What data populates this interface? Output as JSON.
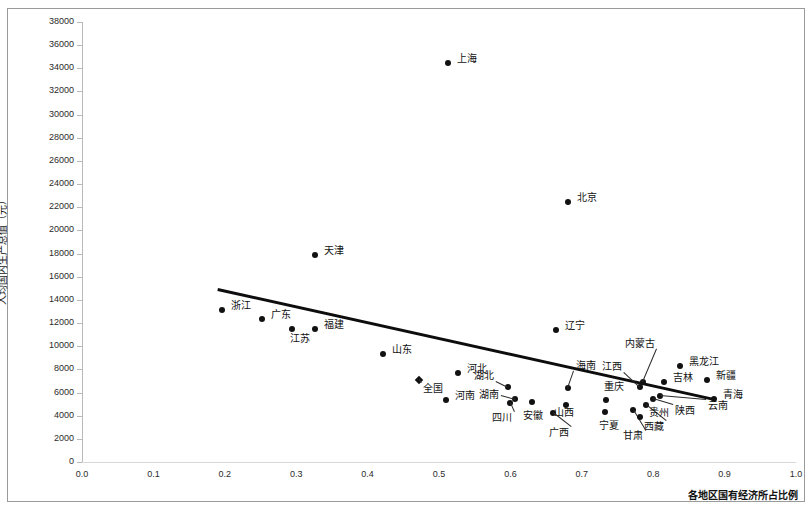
{
  "chart_data": {
    "type": "scatter",
    "title": "",
    "xlabel": "各地区国有经济所占比例",
    "ylabel": "人均国内生产总值（元）",
    "xlim": [
      0.0,
      1.0
    ],
    "ylim": [
      0,
      38000
    ],
    "xticks": [
      "0.0",
      "0.1",
      "0.2",
      "0.3",
      "0.4",
      "0.5",
      "0.6",
      "0.7",
      "0.8",
      "0.9",
      "1.0"
    ],
    "yticks": [
      "0",
      "2000",
      "4000",
      "6000",
      "8000",
      "10000",
      "12000",
      "14000",
      "16000",
      "18000",
      "20000",
      "22000",
      "24000",
      "26000",
      "28000",
      "30000",
      "32000",
      "34000",
      "36000",
      "38000"
    ],
    "grid": false,
    "legend": "none",
    "marker_color": "#111111",
    "trendline": {
      "color": "#0d0d0d",
      "x0": 0.19,
      "y0": 15000,
      "x1": 0.885,
      "y1": 5500
    },
    "points": [
      {
        "name": "上海",
        "x": 0.512,
        "y": 34500,
        "label_dx": 9,
        "label_dy": -4,
        "leader": false
      },
      {
        "name": "北京",
        "x": 0.68,
        "y": 22450,
        "label_dx": 9,
        "label_dy": -4,
        "leader": false
      },
      {
        "name": "天津",
        "x": 0.327,
        "y": 17850,
        "label_dx": 9,
        "label_dy": -4,
        "leader": false
      },
      {
        "name": "浙江",
        "x": 0.196,
        "y": 13100,
        "label_dx": 9,
        "label_dy": -4,
        "leader": false
      },
      {
        "name": "广东",
        "x": 0.252,
        "y": 12350,
        "label_dx": 9,
        "label_dy": -4,
        "leader": false
      },
      {
        "name": "江苏",
        "x": 0.294,
        "y": 11450,
        "label_dx": -2,
        "label_dy": 10,
        "leader": false
      },
      {
        "name": "福建",
        "x": 0.326,
        "y": 11450,
        "label_dx": 9,
        "label_dy": -4,
        "leader": false
      },
      {
        "name": "山东",
        "x": 0.422,
        "y": 9350,
        "label_dx": 9,
        "label_dy": -4,
        "leader": false
      },
      {
        "name": "辽宁",
        "x": 0.664,
        "y": 11400,
        "label_dx": 9,
        "label_dy": -4,
        "leader": false
      },
      {
        "name": "全国",
        "x": 0.472,
        "y": 7100,
        "label_dx": 4,
        "label_dy": 9,
        "leader": true,
        "marker": "diamond"
      },
      {
        "name": "河北",
        "x": 0.527,
        "y": 7700,
        "label_dx": 9,
        "label_dy": -4,
        "leader": false
      },
      {
        "name": "河南",
        "x": 0.51,
        "y": 5350,
        "label_dx": 9,
        "label_dy": -4,
        "leader": false
      },
      {
        "name": "湖北",
        "x": 0.597,
        "y": 6450,
        "label_dx": -34,
        "label_dy": -11,
        "leader": true
      },
      {
        "name": "湖南",
        "x": 0.607,
        "y": 5400,
        "label_dx": -36,
        "label_dy": -4,
        "leader": true
      },
      {
        "name": "海南",
        "x": 0.68,
        "y": 6400,
        "label_dx": 8,
        "label_dy": -22,
        "leader": true
      },
      {
        "name": "重庆",
        "x": 0.734,
        "y": 5350,
        "label_dx": -2,
        "label_dy": -13,
        "leader": false
      },
      {
        "name": "四川",
        "x": 0.6,
        "y": 5100,
        "label_dx": -18,
        "label_dy": 15,
        "leader": true
      },
      {
        "name": "安徽",
        "x": 0.63,
        "y": 5150,
        "label_dx": -9,
        "label_dy": 14,
        "leader": false
      },
      {
        "name": "山西",
        "x": 0.678,
        "y": 4950,
        "label_dx": -12,
        "label_dy": 8,
        "leader": false
      },
      {
        "name": "广西",
        "x": 0.66,
        "y": 4200,
        "label_dx": -4,
        "label_dy": 20,
        "leader": true
      },
      {
        "name": "宁夏",
        "x": 0.733,
        "y": 4350,
        "label_dx": -6,
        "label_dy": 14,
        "leader": false
      },
      {
        "name": "甘肃",
        "x": 0.772,
        "y": 4450,
        "label_dx": -10,
        "label_dy": 26,
        "leader": true
      },
      {
        "name": "西藏",
        "x": 0.79,
        "y": 4950,
        "label_dx": -2,
        "label_dy": 22,
        "leader": true
      },
      {
        "name": "贵州",
        "x": 0.782,
        "y": 3900,
        "label_dx": 9,
        "label_dy": -4,
        "leader": false
      },
      {
        "name": "陕西",
        "x": 0.8,
        "y": 5400,
        "label_dx": 22,
        "label_dy": 12,
        "leader": true
      },
      {
        "name": "云南",
        "x": 0.81,
        "y": 5700,
        "label_dx": 48,
        "label_dy": 10,
        "leader": true
      },
      {
        "name": "江西",
        "x": 0.782,
        "y": 6450,
        "label_dx": -38,
        "label_dy": -20,
        "leader": true
      },
      {
        "name": "内蒙古",
        "x": 0.786,
        "y": 6950,
        "label_dx": -18,
        "label_dy": -38,
        "leader": true
      },
      {
        "name": "吉林",
        "x": 0.815,
        "y": 6950,
        "label_dx": 9,
        "label_dy": -4,
        "leader": false
      },
      {
        "name": "黑龙江",
        "x": 0.838,
        "y": 8300,
        "label_dx": 9,
        "label_dy": -4,
        "leader": false
      },
      {
        "name": "新疆",
        "x": 0.876,
        "y": 7100,
        "label_dx": 9,
        "label_dy": -4,
        "leader": false
      },
      {
        "name": "青海",
        "x": 0.885,
        "y": 5400,
        "label_dx": 9,
        "label_dy": -4,
        "leader": false
      }
    ]
  }
}
